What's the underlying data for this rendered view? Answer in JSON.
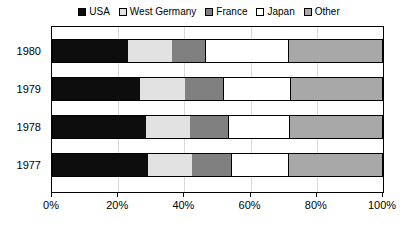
{
  "chart_data": {
    "type": "bar",
    "orientation": "horizontal",
    "stacked": true,
    "normalized_percent": true,
    "title": "",
    "subtitle": "",
    "xlabel": "",
    "ylabel": "",
    "categories": [
      "1980",
      "1979",
      "1978",
      "1977"
    ],
    "xlim": [
      0,
      100
    ],
    "xticks": [
      0,
      20,
      40,
      60,
      80,
      100
    ],
    "xtick_labels": [
      "0%",
      "20%",
      "40%",
      "60%",
      "80%",
      "100%"
    ],
    "grid": "vertical",
    "legend_position": "top-center",
    "series": [
      {
        "name": "USA",
        "color": "#0d0d0d",
        "values": [
          23.0,
          26.6,
          28.4,
          29.0
        ]
      },
      {
        "name": "West Germany",
        "color": "#e2e2e2",
        "values": [
          13.3,
          13.6,
          13.3,
          13.3
        ]
      },
      {
        "name": "France",
        "color": "#808080",
        "values": [
          10.0,
          11.5,
          11.5,
          11.8
        ]
      },
      {
        "name": "Japan",
        "color": "#ffffff",
        "values": [
          25.4,
          20.5,
          18.7,
          17.5
        ]
      },
      {
        "name": "Other",
        "color": "#a8a8a8",
        "values": [
          28.3,
          27.8,
          28.1,
          28.4
        ]
      }
    ]
  },
  "legend": {
    "items": [
      {
        "label": "USA",
        "color": "#0d0d0d"
      },
      {
        "label": "West Germany",
        "color": "#e2e2e2"
      },
      {
        "label": "France",
        "color": "#808080"
      },
      {
        "label": "Japan",
        "color": "#ffffff"
      },
      {
        "label": "Other",
        "color": "#a8a8a8"
      }
    ]
  },
  "axes": {
    "y_categories": [
      "1980",
      "1979",
      "1978",
      "1977"
    ],
    "x_tick_labels": [
      "0%",
      "20%",
      "40%",
      "60%",
      "80%",
      "100%"
    ]
  }
}
